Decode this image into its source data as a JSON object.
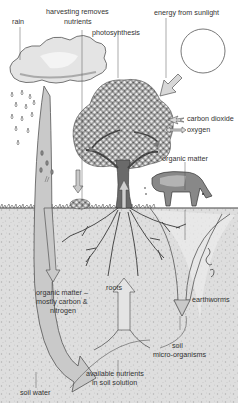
{
  "diagram": {
    "labels": {
      "rain": "rain",
      "harvesting_1": "harvesting removes",
      "harvesting_2": "nutrients",
      "photosynthesis": "photosynthesis",
      "energy": "energy from sunlight",
      "carbon_dioxide": "carbon dioxide",
      "oxygen": "oxygen",
      "organic_matter_top": "organic matter",
      "organic_matter_1": "organic matter –",
      "organic_matter_2": "mostly carbon &",
      "organic_matter_3": "nitrogen",
      "roots": "roots",
      "earthworms": "earthworms",
      "soil_micro_1": "soil",
      "soil_micro_2": "micro-organisms",
      "available_1": "available nutrients",
      "available_2": "in soil solution",
      "soil_water": "soil water"
    },
    "colors": {
      "sky": "#ffffff",
      "soil": "#dcdcdc",
      "soil_speckle": "#b8b8b8",
      "arrow_fill": "#c4c4c4",
      "arrow_stroke": "#555555",
      "tree": "#555555",
      "text": "#333333"
    }
  }
}
